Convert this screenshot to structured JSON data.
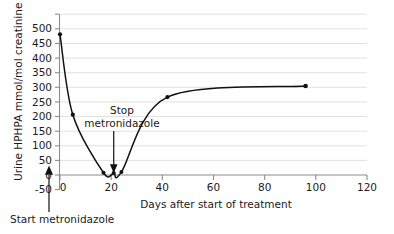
{
  "chart_data": {
    "type": "line",
    "title": "",
    "xlabel": "Days after start of treatment",
    "ylabel": "Urine HPHPA mmol/mol creatinine",
    "xlim": [
      0,
      120
    ],
    "ylim": [
      -50,
      500
    ],
    "xticks": [
      "0",
      "20",
      "40",
      "60",
      "80",
      "100",
      "120"
    ],
    "xtick_values": [
      0,
      20,
      40,
      60,
      80,
      100,
      120
    ],
    "yticks": [
      "-50",
      "0",
      "50",
      "100",
      "150",
      "200",
      "250",
      "300",
      "350",
      "400",
      "450",
      "500"
    ],
    "ytick_values": [
      -50,
      0,
      50,
      100,
      150,
      200,
      250,
      300,
      350,
      400,
      450,
      500
    ],
    "grid": "horizontal",
    "legend": "none",
    "series": [
      {
        "name": "Urine HPHPA",
        "x": [
          0,
          5,
          17,
          21,
          24,
          42,
          96
        ],
        "values": [
          437,
          185,
          3,
          2,
          5,
          240,
          275
        ]
      }
    ],
    "annotations": [
      {
        "id": "stop-metronidazole",
        "line1": "Stop",
        "line2": "metronidazole",
        "x": 21,
        "y": 0
      },
      {
        "id": "start-metronidazole",
        "text": "Start metronidazole",
        "x": 0,
        "y": 0
      }
    ]
  }
}
